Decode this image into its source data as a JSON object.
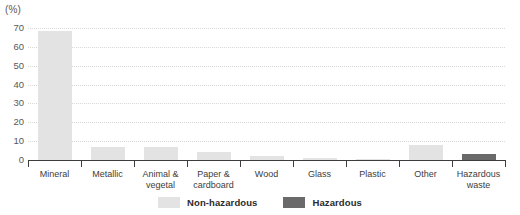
{
  "axis_unit_label": "(%)",
  "legend": {
    "items": [
      {
        "label": "Non-hazardous",
        "color": "#e3e3e3",
        "key": "nonhazardous"
      },
      {
        "label": "Hazardous",
        "color": "#6a6a6a",
        "key": "hazardous"
      }
    ]
  },
  "chart_data": {
    "type": "bar",
    "title": "",
    "subtitle": "",
    "xlabel": "",
    "ylabel": "(%)",
    "ylim": [
      0,
      70
    ],
    "yticks": [
      0,
      10,
      20,
      30,
      40,
      50,
      60,
      70
    ],
    "ytick_labels": [
      "0",
      "10",
      "20",
      "30",
      "40",
      "50",
      "60",
      "70"
    ],
    "grid": true,
    "legend_position": "bottom-center",
    "categories": [
      "Mineral",
      "Metallic",
      "Animal & vegetal",
      "Paper & cardboard",
      "Wood",
      "Glass",
      "Plastic",
      "Other",
      "Hazardous waste"
    ],
    "category_lines": [
      [
        "Mineral"
      ],
      [
        "Metallic"
      ],
      [
        "Animal &",
        "vegetal"
      ],
      [
        "Paper &",
        "cardboard"
      ],
      [
        "Wood"
      ],
      [
        "Glass"
      ],
      [
        "Plastic"
      ],
      [
        "Other"
      ],
      [
        "Hazardous",
        "waste"
      ]
    ],
    "series": [
      {
        "name": "Non-hazardous",
        "color": "#e3e3e3",
        "values": [
          68.5,
          7.0,
          6.7,
          4.0,
          2.0,
          1.0,
          0.6,
          8.0,
          null
        ]
      },
      {
        "name": "Hazardous",
        "color": "#6a6a6a",
        "values": [
          null,
          null,
          null,
          null,
          null,
          null,
          null,
          null,
          3.0
        ]
      }
    ]
  }
}
